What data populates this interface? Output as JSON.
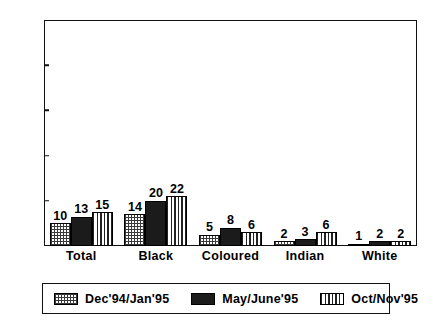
{
  "chart_data": {
    "type": "bar",
    "title": "",
    "subtitle": "",
    "xlabel": "",
    "ylabel": "",
    "ylim": [
      0,
      100
    ],
    "yticks": [
      0,
      20,
      40,
      60,
      80,
      100
    ],
    "grid": false,
    "legend_position": "bottom",
    "categories": [
      "Total",
      "Black",
      "Coloured",
      "Indian",
      "White"
    ],
    "series": [
      {
        "name": "Dec'94/Jan'95",
        "pattern": "crosshatch-light",
        "values": [
          10,
          14,
          5,
          2,
          1
        ]
      },
      {
        "name": "May/June'95",
        "pattern": "checker-dark",
        "values": [
          13,
          20,
          8,
          3,
          2
        ]
      },
      {
        "name": "Oct/Nov'95",
        "pattern": "vertical-stripes",
        "values": [
          15,
          22,
          6,
          6,
          2
        ]
      }
    ],
    "data_labels": [
      [
        "10",
        "13",
        "15"
      ],
      [
        "14",
        "20",
        "22"
      ],
      [
        "5",
        "8",
        "6"
      ],
      [
        "2",
        "3",
        "6"
      ],
      [
        "1",
        "2",
        "2"
      ]
    ],
    "colors": {
      "axis": "#111111",
      "bar_outline": "#000000",
      "background": "#ffffff"
    }
  },
  "axis": {
    "y_tick_labels": [
      "0",
      "20",
      "40",
      "60",
      "80",
      "100"
    ]
  },
  "legend": {
    "entries": [
      {
        "label": "Dec'94/Jan'95"
      },
      {
        "label": "May/June'95"
      },
      {
        "label": "Oct/Nov'95"
      }
    ]
  }
}
